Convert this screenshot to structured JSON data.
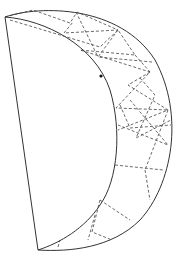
{
  "diagram": {
    "type": "geometric-line-drawing",
    "colors": {
      "background": "#ffffff",
      "outline": "#333333",
      "rays": "#444444",
      "dot": "#111111"
    },
    "shape": {
      "chord": {
        "from": [
          5,
          17
        ],
        "to": [
          38,
          250
        ]
      },
      "outer_arc": {
        "from": [
          5,
          17
        ],
        "control_note": "bulges right to x≈172 at y≈135",
        "to": [
          38,
          250
        ]
      },
      "inner_arc": {
        "from": [
          5,
          17
        ],
        "control_note": "bulges right to x≈117 at y≈125",
        "to": [
          38,
          250
        ]
      }
    },
    "marker_dot": [
      101,
      76
    ],
    "rays": [
      [
        [
          5,
          17
        ],
        [
          33,
          10
        ],
        [
          70,
          23
        ],
        [
          77,
          12
        ],
        [
          118,
          30
        ],
        [
          64,
          33
        ]
      ],
      [
        [
          64,
          33
        ],
        [
          73,
          22
        ]
      ],
      [
        [
          10,
          20
        ],
        [
          100,
          47
        ],
        [
          118,
          30
        ],
        [
          135,
          55
        ],
        [
          80,
          50
        ],
        [
          150,
          72
        ]
      ],
      [
        [
          118,
          30
        ],
        [
          98,
          57
        ],
        [
          152,
          62
        ]
      ],
      [
        [
          76,
          12
        ],
        [
          98,
          57
        ]
      ],
      [
        [
          135,
          55
        ],
        [
          150,
          72
        ],
        [
          116,
          108
        ],
        [
          168,
          110
        ]
      ],
      [
        [
          150,
          72
        ],
        [
          128,
          85
        ],
        [
          168,
          110
        ],
        [
          118,
          130
        ]
      ],
      [
        [
          140,
          78
        ],
        [
          155,
          95
        ],
        [
          136,
          138
        ],
        [
          171,
          120
        ]
      ],
      [
        [
          120,
          105
        ],
        [
          130,
          128
        ],
        [
          171,
          125
        ]
      ],
      [
        [
          130,
          100
        ],
        [
          168,
          145
        ],
        [
          118,
          125
        ]
      ],
      [
        [
          168,
          110
        ],
        [
          145,
          170
        ]
      ],
      [
        [
          115,
          165
        ],
        [
          163,
          170
        ]
      ],
      [
        [
          145,
          170
        ],
        [
          150,
          200
        ]
      ],
      [
        [
          100,
          200
        ],
        [
          130,
          220
        ]
      ],
      [
        [
          100,
          200
        ],
        [
          92,
          232
        ],
        [
          112,
          240
        ]
      ],
      [
        [
          95,
          215
        ],
        [
          88,
          240
        ]
      ],
      [
        [
          58,
          247
        ],
        [
          60,
          240
        ]
      ]
    ]
  }
}
